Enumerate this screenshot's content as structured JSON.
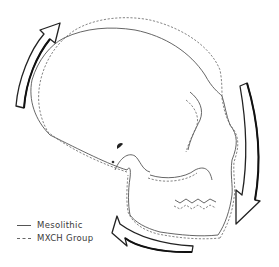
{
  "figure": {
    "colors": {
      "outline": "#555555",
      "arrow": "#222222",
      "background": "#ffffff"
    }
  },
  "legend": {
    "items": [
      {
        "label": "Mesolithic",
        "style": "solid"
      },
      {
        "label": "MXCH Group",
        "style": "dashed"
      }
    ]
  },
  "arrows": [
    {
      "name": "arrow-upper-left",
      "direction": "up-right"
    },
    {
      "name": "arrow-right",
      "direction": "down"
    },
    {
      "name": "arrow-bottom",
      "direction": "left"
    }
  ]
}
